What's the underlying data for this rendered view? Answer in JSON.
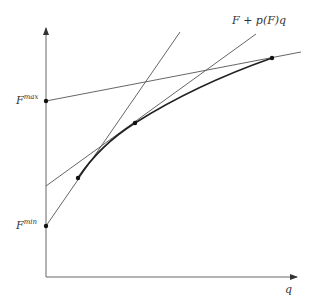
{
  "diagram": {
    "title": "",
    "labels": {
      "x_axis": "q",
      "f_max_base": "F",
      "f_max_sup": "max",
      "f_min_base": "F",
      "f_min_sup": "min",
      "line_label": "F + p(F)q"
    },
    "points": [
      {
        "name": "F-max",
        "x": 46,
        "y": 101
      },
      {
        "name": "F-min",
        "x": 46,
        "y": 226
      },
      {
        "name": "curve-start",
        "x": 78,
        "y": 178
      },
      {
        "name": "curve-middle",
        "x": 135,
        "y": 123
      },
      {
        "name": "curve-end",
        "x": 272,
        "y": 58
      }
    ],
    "colors": {
      "lines": "#555555",
      "curve": "#222222",
      "points": "#111111"
    }
  }
}
